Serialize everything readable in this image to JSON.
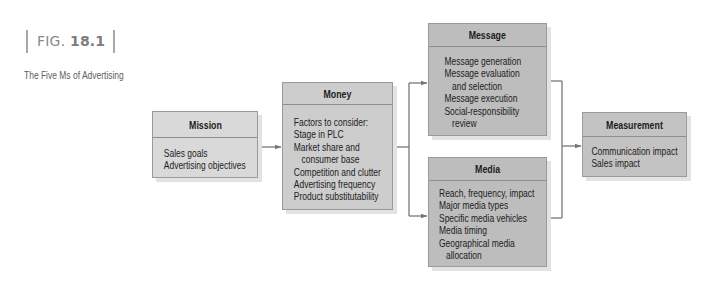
{
  "figure": {
    "label_prefix": "FIG.",
    "label_number": "18.1",
    "title": "The Five Ms of Advertising"
  },
  "boxes": {
    "mission": {
      "title": "Mission",
      "lines": [
        "Sales goals",
        "Advertising objectives"
      ]
    },
    "money": {
      "title": "Money",
      "lines": [
        "Factors to consider:",
        "Stage in PLC",
        "Market share and",
        "consumer base",
        "Competition and clutter",
        "Advertising frequency",
        "Product substitutability"
      ]
    },
    "message": {
      "title": "Message",
      "lines": [
        "Message generation",
        "Message evaluation",
        "and selection",
        "Message execution",
        "Social-responsibility",
        "review"
      ]
    },
    "media": {
      "title": "Media",
      "lines": [
        "Reach, frequency, impact",
        "Major media types",
        "Specific media vehicles",
        "Media timing",
        "Geographical media",
        "allocation"
      ]
    },
    "measurement": {
      "title": "Measurement",
      "lines": [
        "Communication impact",
        "Sales impact"
      ]
    }
  },
  "connectors": [
    {
      "from": "Mission",
      "to": "Money"
    },
    {
      "from": "Money",
      "to": "Message"
    },
    {
      "from": "Money",
      "to": "Media"
    },
    {
      "from": "Message",
      "to": "Measurement"
    },
    {
      "from": "Media",
      "to": "Measurement"
    }
  ],
  "colors": {
    "line": "#777777",
    "mission_fill": "#d9d9d9",
    "money_fill": "#cdcdcd",
    "message_fill": "#bdbdbd",
    "media_fill": "#bdbdbd",
    "measurement_fill": "#c3c3c3"
  }
}
